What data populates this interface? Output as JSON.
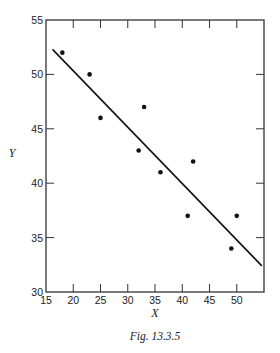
{
  "chart_data": {
    "type": "scatter",
    "title": "",
    "caption": "Fig. 13.3.5",
    "xlabel": "X",
    "ylabel": "Y",
    "xlim": [
      15,
      55
    ],
    "ylim": [
      30,
      55
    ],
    "xticks": [
      15,
      20,
      25,
      30,
      35,
      40,
      45,
      50
    ],
    "yticks": [
      30,
      35,
      40,
      45,
      50,
      55
    ],
    "grid": false,
    "legend": null,
    "series": [
      {
        "name": "observations",
        "type": "scatter",
        "points": [
          {
            "x": 18,
            "y": 52
          },
          {
            "x": 23,
            "y": 50
          },
          {
            "x": 25,
            "y": 46
          },
          {
            "x": 32,
            "y": 43
          },
          {
            "x": 33,
            "y": 47
          },
          {
            "x": 36,
            "y": 41
          },
          {
            "x": 41,
            "y": 37
          },
          {
            "x": 42,
            "y": 42
          },
          {
            "x": 49,
            "y": 34
          },
          {
            "x": 50,
            "y": 37
          }
        ]
      },
      {
        "name": "fitted line",
        "type": "line",
        "points": [
          {
            "x": 16.2,
            "y": 52.3
          },
          {
            "x": 54.6,
            "y": 32.4
          }
        ]
      }
    ]
  }
}
